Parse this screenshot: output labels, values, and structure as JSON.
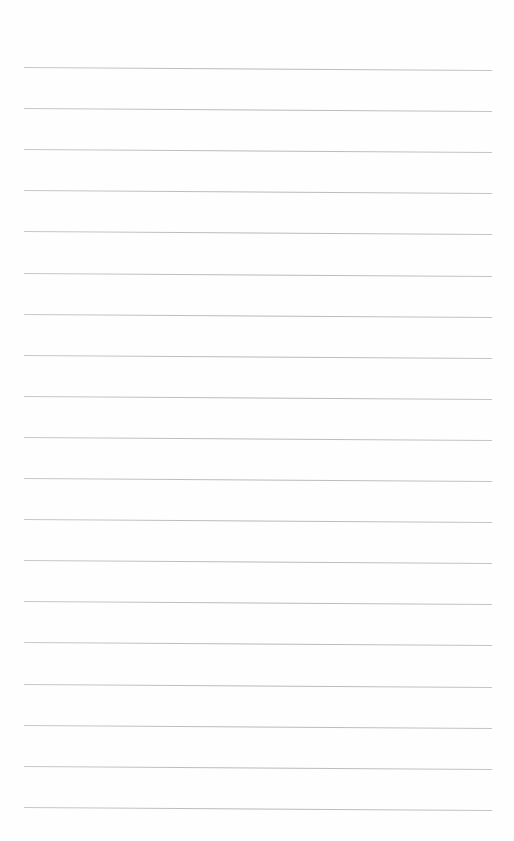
{
  "page": {
    "type": "blank ruled paper",
    "background_color": "#fefefe",
    "line_color": "#bdbdbd",
    "line_count": 19,
    "first_line_y": 67,
    "line_spacing": 41.1,
    "line_left_x": 24,
    "line_right_x": 492,
    "line_slant_px": 3
  }
}
